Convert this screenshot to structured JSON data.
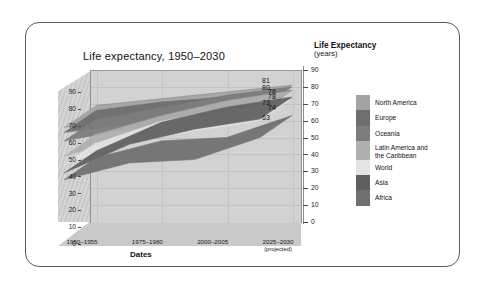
{
  "figure": {
    "title": "Life expectancy, 1950–2030",
    "x_axis_title": "Dates",
    "right_axis_caption_main": "Life Expectancy",
    "right_axis_caption_sub": "(years)"
  },
  "chart_data": {
    "type": "line",
    "title": "Life expectancy, 1950–2030",
    "subtitle": "",
    "xlabel": "Dates",
    "ylabel": "Life Expectancy (years)",
    "ylim": [
      0,
      90
    ],
    "yticks": [
      0,
      10,
      20,
      30,
      40,
      50,
      60,
      70,
      80,
      90
    ],
    "left_axis_ticks": [
      0,
      10,
      20,
      30,
      40,
      50,
      60,
      70,
      80,
      90
    ],
    "right_axis_ticks": [
      0,
      10,
      20,
      30,
      40,
      50,
      60,
      70,
      80,
      90
    ],
    "grid": true,
    "legend_position": "right",
    "projection": "3d-ribbon",
    "categories": [
      "1950–1955",
      "1975–1980",
      "2000–2005",
      "2025–2030 (projected)"
    ],
    "x_tick_labels": [
      {
        "line1": "1950–1955",
        "line2": ""
      },
      {
        "line1": "1975–1980",
        "line2": ""
      },
      {
        "line1": "2000–2005",
        "line2": ""
      },
      {
        "line1": "2025–2030",
        "line2": "(projected)"
      }
    ],
    "series": [
      {
        "name": "North America",
        "color": "#a3a3a3",
        "values": [
          69,
          73,
          77,
          81
        ],
        "end_label": "81"
      },
      {
        "name": "Europe",
        "color": "#6e6e6e",
        "values": [
          66,
          71,
          74,
          78
        ],
        "end_label": "78"
      },
      {
        "name": "Oceania",
        "color": "#7d7d7d",
        "values": [
          61,
          68,
          75,
          80
        ],
        "end_label": "80"
      },
      {
        "name": "Latin America and\nthe Caribbean",
        "color": "#b0b0b0",
        "values": [
          52,
          63,
          72,
          78
        ],
        "end_label": "78"
      },
      {
        "name": "World",
        "color": "#e3e3e3",
        "values": [
          47,
          60,
          67,
          73
        ],
        "end_label": "73"
      },
      {
        "name": "Asia",
        "color": "#5f5f5f",
        "values": [
          42,
          59,
          68,
          74
        ],
        "end_label": "74"
      },
      {
        "name": "Africa",
        "color": "#707070",
        "values": [
          38,
          48,
          50,
          63
        ],
        "end_label": "63"
      }
    ],
    "end_value_labels": [
      "81",
      "78",
      "80",
      "78",
      "73",
      "74",
      "63"
    ]
  },
  "legend": {
    "items": [
      {
        "label": "North America",
        "color": "#a3a3a3"
      },
      {
        "label": "Europe",
        "color": "#6e6e6e"
      },
      {
        "label": "Oceania",
        "color": "#7d7d7d"
      },
      {
        "label": "Latin America and\nthe Caribbean",
        "color": "#b0b0b0"
      },
      {
        "label": "World",
        "color": "#e3e3e3"
      },
      {
        "label": "Asia",
        "color": "#5f5f5f"
      },
      {
        "label": "Africa",
        "color": "#707070"
      }
    ]
  },
  "colors": {
    "frame_border": "#5a5a5a",
    "plot_back": "#d2d2d2",
    "plot_floor": "#c9c9c9",
    "plot_left_wall": "#cfcfcf",
    "gridline": "#c2c2c2",
    "axis_line": "#8e8e8e",
    "text": "#111111"
  }
}
